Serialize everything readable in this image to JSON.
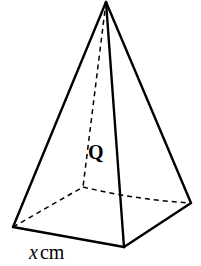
{
  "figure": {
    "type": "square-pyramid",
    "background_color": "#ffffff",
    "stroke_color": "#000000",
    "solid_stroke_width": 2.4,
    "dashed_stroke_width": 1.5,
    "dash_pattern": "5,4",
    "vertices": {
      "apex": {
        "name": "apex",
        "x": 106,
        "y": 2
      },
      "base_left": {
        "name": "base-left-corner",
        "x": 13,
        "y": 227
      },
      "base_front": {
        "name": "base-front-corner",
        "x": 124,
        "y": 247
      },
      "base_right": {
        "name": "base-right-corner",
        "x": 191,
        "y": 203
      },
      "base_back_hidden": {
        "name": "base-back-corner-hidden",
        "x": 83,
        "y": 187
      }
    },
    "solid_edges": [
      {
        "name": "edge-apex-to-left",
        "from": "apex",
        "to": "base_left"
      },
      {
        "name": "edge-apex-to-front",
        "from": "apex",
        "to": "base_front"
      },
      {
        "name": "edge-apex-to-right",
        "from": "apex",
        "to": "base_right"
      },
      {
        "name": "edge-base-left-to-front",
        "from": "base_left",
        "to": "base_front"
      },
      {
        "name": "edge-base-front-to-right",
        "from": "base_front",
        "to": "base_right"
      }
    ],
    "dashed_edges": [
      {
        "name": "edge-apex-to-back-hidden",
        "from": "apex",
        "to": "base_back_hidden"
      },
      {
        "name": "edge-base-left-to-back-hidden",
        "from": "base_left",
        "to": "base_back_hidden"
      },
      {
        "name": "edge-base-back-to-right-hidden",
        "from": "base_back_hidden",
        "to": "base_right"
      }
    ]
  },
  "labels": {
    "vertex_label": "Q",
    "base_measure_variable": "x",
    "base_measure_unit": "cm"
  }
}
